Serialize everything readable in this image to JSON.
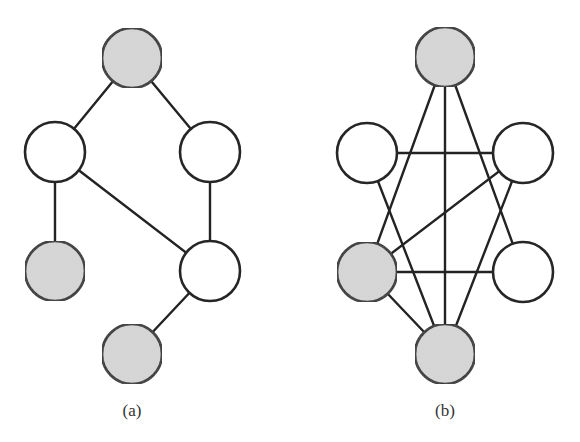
{
  "colors": {
    "background": "#ffffff",
    "stroke": "#262626",
    "node_shaded": "#d8d8d8",
    "node_unshaded": "#ffffff"
  },
  "node_radius": 30,
  "graphs": [
    {
      "id": "a",
      "caption": "(a)",
      "caption_pos": {
        "x": 132,
        "y": 401
      },
      "nodes": [
        {
          "id": "top",
          "x": 132,
          "y": 58,
          "shaded": true
        },
        {
          "id": "ml",
          "x": 55,
          "y": 152,
          "shaded": false
        },
        {
          "id": "mr",
          "x": 210,
          "y": 152,
          "shaded": false
        },
        {
          "id": "bl",
          "x": 55,
          "y": 271,
          "shaded": true
        },
        {
          "id": "br",
          "x": 210,
          "y": 271,
          "shaded": false
        },
        {
          "id": "bot",
          "x": 132,
          "y": 354,
          "shaded": true
        }
      ],
      "edges": [
        [
          "top",
          "ml"
        ],
        [
          "top",
          "mr"
        ],
        [
          "ml",
          "bl"
        ],
        [
          "ml",
          "br"
        ],
        [
          "mr",
          "br"
        ],
        [
          "br",
          "bot"
        ]
      ]
    },
    {
      "id": "b",
      "caption": "(b)",
      "caption_pos": {
        "x": 445,
        "y": 401
      },
      "nodes": [
        {
          "id": "top",
          "x": 445,
          "y": 57,
          "shaded": true
        },
        {
          "id": "ml",
          "x": 367,
          "y": 153,
          "shaded": false
        },
        {
          "id": "mr",
          "x": 523,
          "y": 153,
          "shaded": false
        },
        {
          "id": "bl",
          "x": 367,
          "y": 272,
          "shaded": true
        },
        {
          "id": "br",
          "x": 523,
          "y": 272,
          "shaded": false
        },
        {
          "id": "bot",
          "x": 445,
          "y": 354,
          "shaded": true
        }
      ],
      "edges": [
        [
          "top",
          "bl"
        ],
        [
          "top",
          "bot"
        ],
        [
          "top",
          "br"
        ],
        [
          "ml",
          "mr"
        ],
        [
          "ml",
          "bot"
        ],
        [
          "mr",
          "bl"
        ],
        [
          "mr",
          "bot"
        ],
        [
          "bl",
          "br"
        ],
        [
          "bl",
          "bot"
        ]
      ]
    }
  ]
}
